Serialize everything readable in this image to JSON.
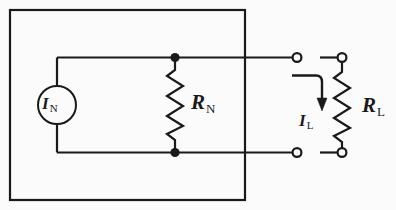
{
  "diagram": {
    "background_color": "#fbfbfb",
    "line_color": "#1a1a1a",
    "box": {
      "name": "norton-source-box",
      "x": 10,
      "y": 10,
      "width": 235,
      "height": 190
    },
    "labels": {
      "current_source": {
        "symbol": "I",
        "subscript": "N",
        "text": "IN"
      },
      "norton_resistor": {
        "symbol": "R",
        "subscript": "N",
        "text": "RN"
      },
      "load_current": {
        "symbol": "I",
        "subscript": "L",
        "text": "IL"
      },
      "load_resistor": {
        "symbol": "R",
        "subscript": "L",
        "text": "RL"
      }
    },
    "components": {
      "current_source": {
        "cx": 57,
        "cy": 105,
        "r": 19
      },
      "norton_resistor": {
        "x": 175,
        "y_top": 58,
        "y_bottom": 152,
        "zigzags": 6
      },
      "load_resistor": {
        "x": 342,
        "y_top": 57,
        "y_bottom": 152,
        "zigzags": 6
      },
      "junction_dots": [
        {
          "x": 175,
          "y": 58
        },
        {
          "x": 175,
          "y": 152
        }
      ],
      "open_terminals": [
        {
          "x": 297,
          "y": 57
        },
        {
          "x": 342,
          "y": 57
        },
        {
          "x": 297,
          "y": 152
        },
        {
          "x": 342,
          "y": 152
        }
      ],
      "current_arrow": {
        "x_start": 292,
        "y_start": 75,
        "x_turn": 322,
        "y_end": 110
      }
    }
  }
}
